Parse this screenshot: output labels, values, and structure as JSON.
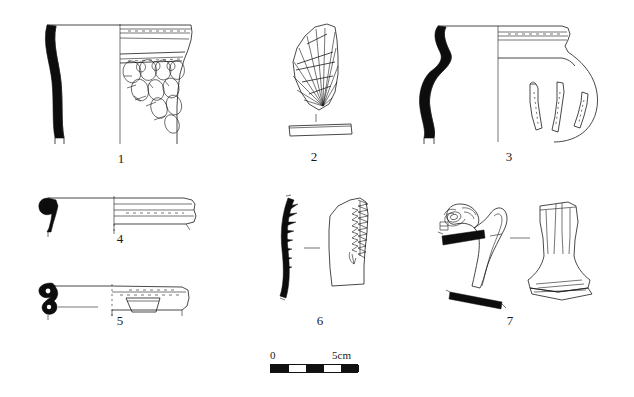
{
  "plate": {
    "type": "archaeological-pottery-illustration-plate",
    "background_color": "#ffffff",
    "ink_color": "#1a1a1a",
    "width": 634,
    "height": 397,
    "figure_count": 7
  },
  "figures": [
    {
      "number": "1",
      "label": "1",
      "name": "carinated-bowl-with-oval-impressed-decoration",
      "label_x": 106,
      "label_y": 152,
      "description": "Large open vessel; left half shows solid black wall profile section, right half shows exterior with horizontal rim bands and rows of oval impressed/applied medallions"
    },
    {
      "number": "2",
      "label": "2",
      "name": "fan-radiating-incised-sherd",
      "label_x": 299,
      "label_y": 150,
      "description": "Body sherd with radiating fan of incised lines, with separate cross-section bar drawn below"
    },
    {
      "number": "3",
      "label": "3",
      "name": "globular-jar-with-applied-strips",
      "label_x": 494,
      "label_y": 150,
      "description": "Globular jar; left half black wall profile with everted rim, right half exterior with neck bands and three curved applied strips"
    },
    {
      "number": "4",
      "label": "4",
      "name": "everted-rim-bowl-profile",
      "label_x": 105,
      "label_y": 232,
      "description": "Shallow bowl rim; hooked solid black rim section at left, exterior profile with grooved bands at right"
    },
    {
      "number": "5",
      "label": "5",
      "name": "rim-sherd-with-lug-handle",
      "label_x": 105,
      "label_y": 314,
      "description": "Rim with thick bulbous black section at left and exterior showing trapezoidal lug/handle attachment below rim"
    },
    {
      "number": "6",
      "label": "6",
      "name": "sherd-with-serrated-applied-cordon",
      "label_x": 305,
      "label_y": 314,
      "description": "Curved black wall section bearing triangular notches, shown beside exterior view with sawtooth/serrated crested edge"
    },
    {
      "number": "7",
      "label": "7",
      "name": "zoomorphic-handle-and-flaring-foot",
      "label_x": 495,
      "label_y": 314,
      "description": "Zoomorphic (animal-head) handle in profile with solid black bar elements, beside a flaring pedestal foot in frontal view"
    }
  ],
  "scale_bar": {
    "name": "scale-bar",
    "start_label": "0",
    "end_label": "5cm",
    "total_length_cm": 5,
    "segments": 5,
    "segment_colors": [
      "black",
      "white",
      "black",
      "white",
      "black"
    ],
    "x": 270,
    "y": 364,
    "pixel_length": 88
  }
}
